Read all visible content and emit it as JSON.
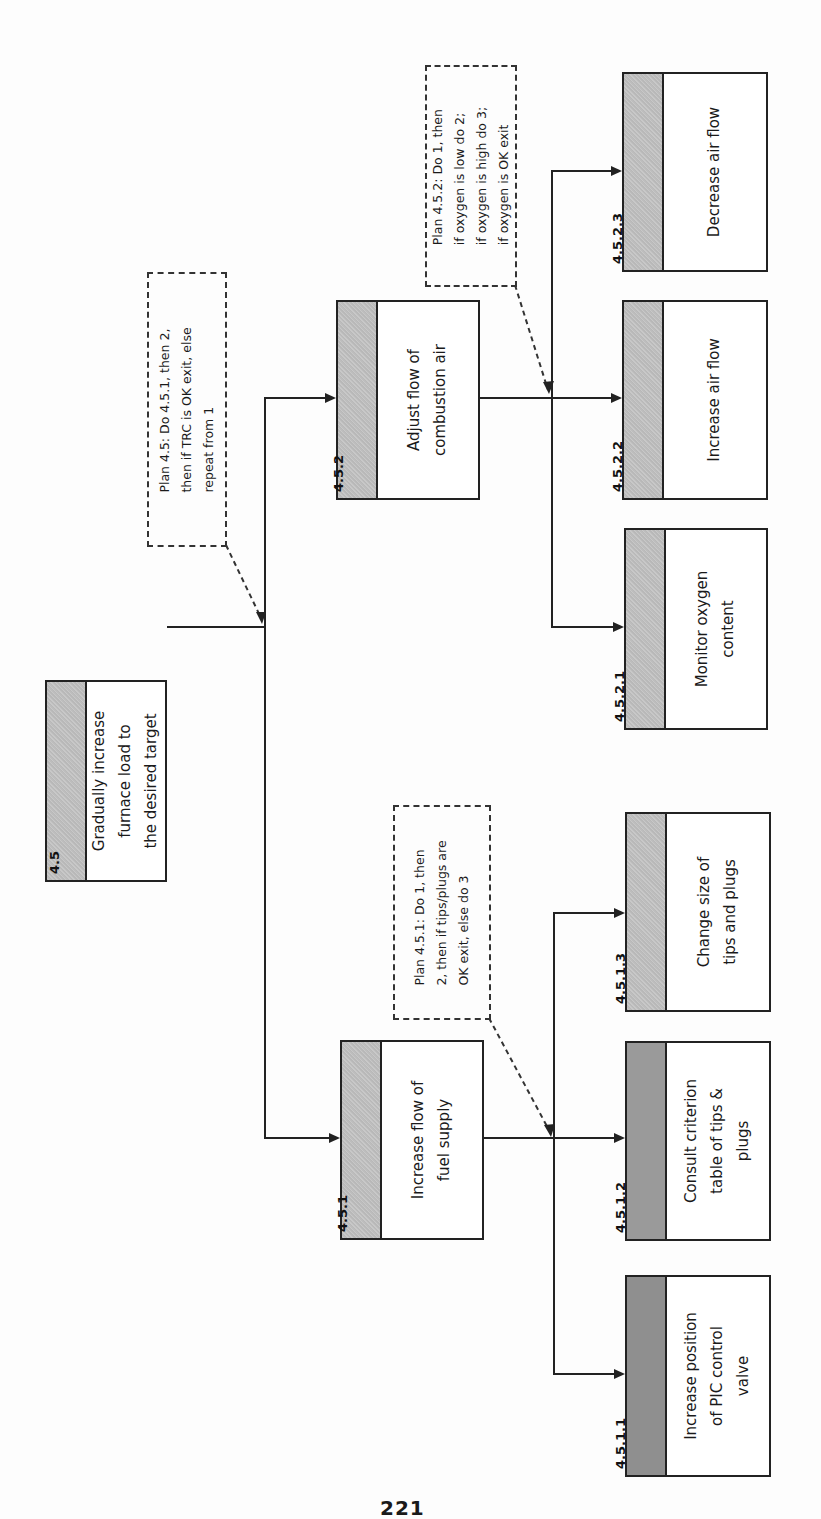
{
  "diagram": {
    "type": "hierarchical task analysis",
    "root": {
      "id": "4.5",
      "label_lines": [
        "Gradually increase",
        "furnace load to",
        "the desired target"
      ]
    },
    "plans": [
      {
        "name": "plan-4-5",
        "lines": [
          "Plan 4.5:  Do 4.5.1, then 2,",
          "then if TRC is OK exit, else",
          "repeat from 1"
        ]
      },
      {
        "name": "plan-4-5-1",
        "lines": [
          "Plan 4.5.1:  Do 1, then",
          "2, then if tips/plugs are",
          "OK exit, else do 3"
        ]
      },
      {
        "name": "plan-4-5-2",
        "lines": [
          "Plan 4.5.2:  Do 1, then",
          "if oxygen is low do 2;",
          "if oxygen is high do 3;",
          "if oxygen is OK exit"
        ]
      }
    ],
    "nodes": {
      "n451": {
        "id": "4.5.1",
        "label_lines": [
          "Increase flow of",
          "fuel supply"
        ]
      },
      "n452": {
        "id": "4.5.2",
        "label_lines": [
          "Adjust flow of",
          "combustion air"
        ]
      },
      "n4511": {
        "id": "4.5.1.1",
        "label_lines": [
          "Increase position",
          "of PIC control",
          "valve"
        ]
      },
      "n4512": {
        "id": "4.5.1.2",
        "label_lines": [
          "Consult criterion",
          "table of tips &",
          "plugs"
        ]
      },
      "n4513": {
        "id": "4.5.1.3",
        "label_lines": [
          "Change size of",
          "tips and plugs"
        ]
      },
      "n4521": {
        "id": "4.5.2.1",
        "label_lines": [
          "Monitor oxygen",
          "content"
        ]
      },
      "n4522": {
        "id": "4.5.2.2",
        "label_lines": [
          "Increase air flow"
        ]
      },
      "n4523": {
        "id": "4.5.2.3",
        "label_lines": [
          "Decrease air flow"
        ]
      }
    }
  },
  "page": {
    "number": "221"
  },
  "colors": {
    "header_fill": "#bdbdbd",
    "line": "#222222",
    "background": "#fdfdfd"
  }
}
